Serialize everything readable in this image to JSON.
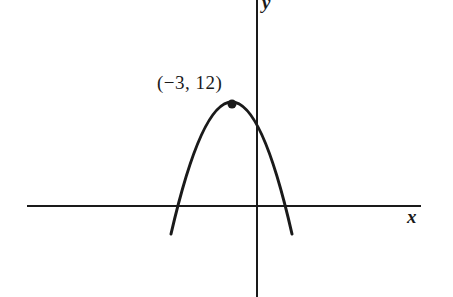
{
  "diagram": {
    "type": "parabola-graph",
    "axes": {
      "x_label": "x",
      "y_label": "y"
    },
    "curve": {
      "shape": "downward-opening parabola",
      "vertex": {
        "x": -3,
        "y": 12
      }
    },
    "vertex_label": "(−3, 12)",
    "colors": {
      "ink": "#1a1a1a",
      "background": "#ffffff"
    }
  }
}
